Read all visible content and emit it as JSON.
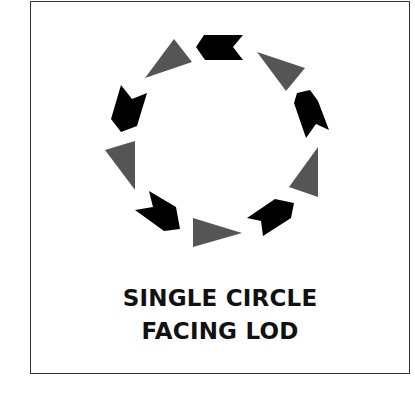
{
  "figure": {
    "title_lines": [
      "SINGLE CIRCLE",
      "FACING LOD"
    ],
    "colors": {
      "frame": "#333333",
      "chevron": "#000000",
      "triangle": "#555555",
      "text": "#111111",
      "background": "#ffffff"
    },
    "arrangement": "circle",
    "shape_count": 10,
    "shapes": [
      {
        "id": "top-chevron",
        "kind": "chevron",
        "points": "196,47 204,35 243,35 233,47 243,60 205,60"
      },
      {
        "id": "upper-right-triangle",
        "kind": "triangle",
        "points": "257,52 305,68 286,91"
      },
      {
        "id": "right-chevron",
        "kind": "chevron",
        "points": "297,93 310,90 318,101 329,130 316,124 306,138 294,103"
      },
      {
        "id": "right-triangle",
        "kind": "triangle",
        "points": "318,147 318,197 289,187"
      },
      {
        "id": "lower-right-chevron",
        "kind": "chevron",
        "points": "247,218 275,199 294,203 291,218 263,236 261,221"
      },
      {
        "id": "bottom-triangle",
        "kind": "triangle",
        "points": "193,218 242,233 193,247"
      },
      {
        "id": "lower-left-chevron",
        "kind": "chevron",
        "points": "149,191 153,207 135,210 164,231 180,229 176,207"
      },
      {
        "id": "left-triangle",
        "kind": "triangle",
        "points": "105,150 135,141 135,190"
      },
      {
        "id": "left-chevron",
        "kind": "chevron",
        "points": "121,85 132,99 147,93 137,126 121,132 111,119"
      },
      {
        "id": "upper-left-triangle",
        "kind": "triangle",
        "points": "174,39 192,62 145,78"
      }
    ]
  }
}
